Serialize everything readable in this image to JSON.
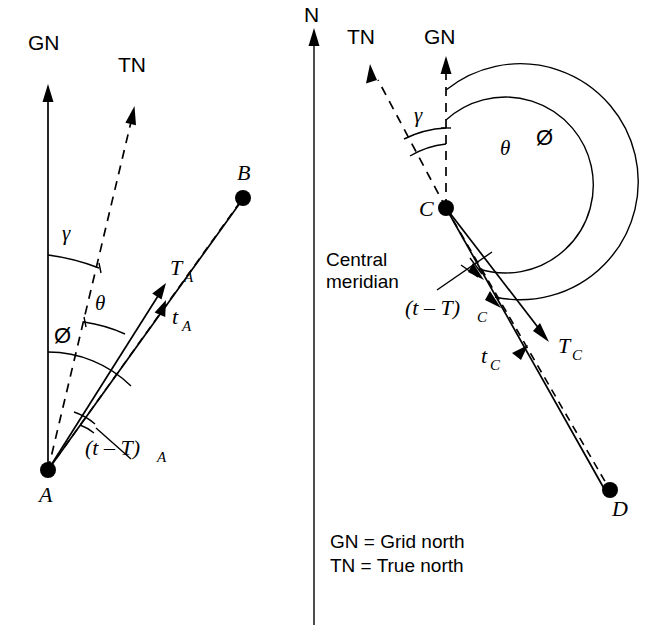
{
  "figure": {
    "title_visible": false,
    "background_color": "#ffffff",
    "ink_color": "#000000",
    "width": 658,
    "height": 635
  },
  "center": {
    "north_label": "N",
    "meridian_label_line1": "Central",
    "meridian_label_line2": "meridian"
  },
  "legend": {
    "line1": "GN = Grid north",
    "line2": "TN = True north"
  },
  "left_diagram": {
    "station_label": "A",
    "target_label": "B",
    "grid_north_label": "GN",
    "true_north_label": "TN",
    "true_bearing_label": "T",
    "true_bearing_sub": "A",
    "grid_bearing_label": "t",
    "grid_bearing_sub": "A",
    "convergence_label": "γ",
    "arc_theta_label": "θ",
    "arc_phi_label": "Ø",
    "correction_label": "(t – T)",
    "correction_sub": "A"
  },
  "right_diagram": {
    "station_label": "C",
    "target_label": "D",
    "grid_north_label": "GN",
    "true_north_label": "TN",
    "true_bearing_label": "T",
    "true_bearing_sub": "C",
    "grid_bearing_label": "t",
    "grid_bearing_sub": "C",
    "convergence_label": "γ",
    "arc_theta_label": "θ",
    "arc_phi_label": "Ø",
    "correction_label": "(t – T)",
    "correction_sub": "C"
  }
}
